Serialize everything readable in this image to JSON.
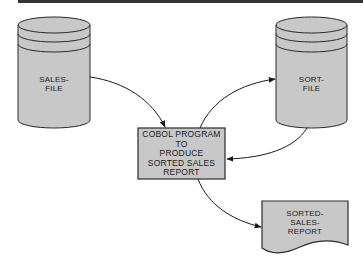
{
  "diagram": {
    "type": "flowchart",
    "colors": {
      "fill": "#c8c8c8",
      "stroke": "#2a2a2a",
      "rule": "#333333",
      "background": "#ffffff"
    },
    "nodes": {
      "sales_file": {
        "shape": "cylinder",
        "line1": "SALES-",
        "line2": "FILE"
      },
      "sort_file": {
        "shape": "cylinder",
        "line1": "SORT-",
        "line2": "FILE"
      },
      "program": {
        "shape": "process",
        "lines": [
          "COBOL PROGRAM",
          "TO",
          "PRODUCE",
          "SORTED SALES",
          "REPORT"
        ]
      },
      "report": {
        "shape": "document",
        "lines": [
          "SORTED-",
          "SALES-",
          "REPORT"
        ]
      }
    },
    "edges": [
      {
        "from": "sales_file",
        "to": "program"
      },
      {
        "from": "program",
        "to": "sort_file"
      },
      {
        "from": "sort_file",
        "to": "program"
      },
      {
        "from": "program",
        "to": "report"
      }
    ]
  }
}
